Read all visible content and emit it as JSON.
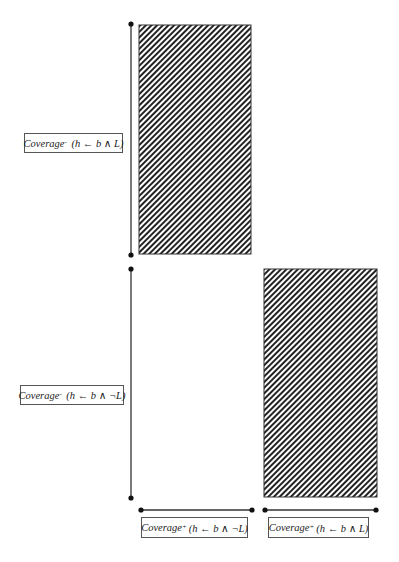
{
  "diagram": {
    "top_panel": {
      "y_axis_label": {
        "name": "Coverage",
        "superscript": "-",
        "expr": "(h ← b ∧ L)"
      },
      "rect": {
        "fill": "hatched",
        "hatch_color": "#222222"
      }
    },
    "bottom_panel": {
      "y_axis_label": {
        "name": "Coverage",
        "superscript": "-",
        "expr": "(h ← b ∧ ¬L)"
      },
      "rect": {
        "fill": "hatched",
        "hatch_color": "#222222"
      }
    },
    "x_axis_labels": [
      {
        "name": "Coverage",
        "superscript": "+",
        "expr": "(h ← b ∧ ¬L)"
      },
      {
        "name": "Coverage",
        "superscript": "+",
        "expr": "(h ← b ∧ L)"
      }
    ],
    "colors": {
      "line": "#333333",
      "dot": "#111111",
      "background": "#ffffff"
    }
  }
}
